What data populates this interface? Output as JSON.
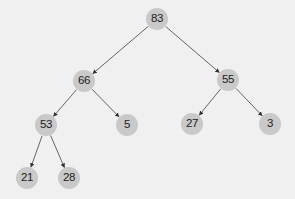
{
  "diagram": {
    "type": "binary-tree",
    "colors": {
      "background": "#f0f0f0",
      "node_fill": "#c9c9c9",
      "node_text": "#222222",
      "edge": "#555555"
    },
    "nodes": [
      {
        "id": "n83",
        "label": "83",
        "x": 157,
        "y": 19
      },
      {
        "id": "n66",
        "label": "66",
        "x": 84,
        "y": 81
      },
      {
        "id": "n55",
        "label": "55",
        "x": 228,
        "y": 80
      },
      {
        "id": "n53",
        "label": "53",
        "x": 46,
        "y": 125
      },
      {
        "id": "n5",
        "label": "5",
        "x": 127,
        "y": 125
      },
      {
        "id": "n27",
        "label": "27",
        "x": 192,
        "y": 124
      },
      {
        "id": "n3",
        "label": "3",
        "x": 270,
        "y": 124
      },
      {
        "id": "n21",
        "label": "21",
        "x": 27,
        "y": 178
      },
      {
        "id": "n28",
        "label": "28",
        "x": 69,
        "y": 178
      }
    ],
    "edges": [
      {
        "from": "83",
        "to": "66"
      },
      {
        "from": "83",
        "to": "55"
      },
      {
        "from": "66",
        "to": "53"
      },
      {
        "from": "66",
        "to": "5"
      },
      {
        "from": "55",
        "to": "27"
      },
      {
        "from": "55",
        "to": "3"
      },
      {
        "from": "53",
        "to": "21"
      },
      {
        "from": "53",
        "to": "28"
      }
    ]
  }
}
